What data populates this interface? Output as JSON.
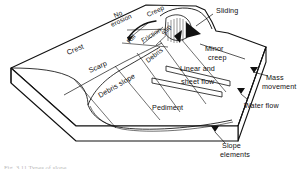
{
  "figure": {
    "type": "block-diagram",
    "caption": "Fig. 3.11 Types of slope"
  },
  "colors": {
    "line": "#111111",
    "fill": "#ffffff",
    "text": "#111111",
    "caption": "#7d7d7d"
  },
  "labels": {
    "no_erosion": "No\nerosion",
    "no_erosion_line1": "No",
    "no_erosion_line2": "erosion",
    "creep": "Creep",
    "rill": "Rill",
    "friction": "Friction",
    "slip": "Slip",
    "sliding": "Sliding",
    "crest": "Crest",
    "scarp": "Scarp",
    "debris": "Debris",
    "debris_slope": "Debris slope",
    "pediment": "Pediment",
    "minor_creep_line1": "Minor",
    "minor_creep_line2": "creep",
    "linear_and": "Linear and",
    "sheet_flow": "sheet flow",
    "mass_movement_line1": "Mass",
    "mass_movement_line2": "movement",
    "water_flow": "Water flow",
    "slope_elements_line1": "Slope",
    "slope_elements_line2": "elements"
  },
  "annotations": {
    "leaders": [
      {
        "name": "mass-movement-leader",
        "label": "Mass movement"
      },
      {
        "name": "water-flow-leader",
        "label": "Water flow"
      },
      {
        "name": "slope-elements-leader",
        "label": "Slope elements"
      },
      {
        "name": "sliding-leader",
        "label": "Sliding"
      }
    ]
  },
  "slope_elements": [
    {
      "id": "crest",
      "label": "Crest",
      "process": "No erosion"
    },
    {
      "id": "scarp",
      "label": "Scarp",
      "process": "Rill / Friction / Slip"
    },
    {
      "id": "debris-slope",
      "label": "Debris slope",
      "process": "Debris"
    },
    {
      "id": "pediment",
      "label": "Pediment",
      "process": "Linear and sheet flow"
    }
  ]
}
